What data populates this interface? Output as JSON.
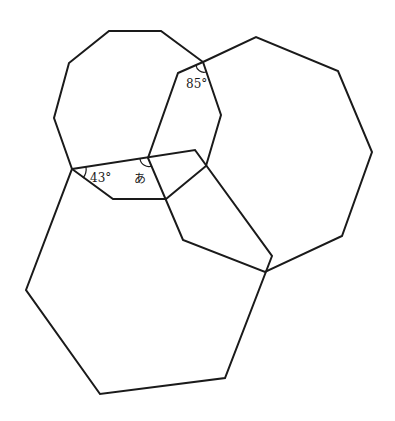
{
  "diagram": {
    "title": "",
    "shapes": [
      {
        "name": "decagon",
        "points": "72,169 54,118 69,63 109,31 161,31 203,62 221,115 206,166 166,199 113,199"
      },
      {
        "name": "nonagon",
        "points": "178,73 203,62 256,37 338,71 372,152 342,236 265,272 183,240 148,158"
      },
      {
        "name": "hexagon",
        "points": "72,169 195,150 272,256 225,378 100,394 26,290"
      }
    ],
    "labels": {
      "angle_43": "43°",
      "angle_85": "85°",
      "angle_unknown": "あ"
    },
    "stroke_color": "#1a1a1a",
    "background": "#ffffff"
  }
}
